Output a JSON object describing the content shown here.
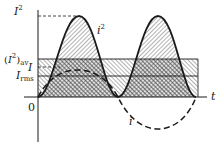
{
  "diagram": {
    "title": "",
    "colors": {
      "ink": "#1a1a1a",
      "hatch": "#555555",
      "background": "#ffffff"
    },
    "labels": {
      "i_squared_axis": {
        "base": "I",
        "sup": "2"
      },
      "i_squared_avg": {
        "open": "(",
        "base": "I",
        "sup": "2",
        "close": ")",
        "sub": "av"
      },
      "i_peak": "I",
      "i_rms": {
        "base": "I",
        "sub": "rms"
      },
      "origin": "0",
      "time_axis": "t",
      "curve_i_squared": {
        "base": "i",
        "sup": "2"
      },
      "curve_i": "i"
    },
    "legend_notes": {
      "solid_curve": "i squared (instantaneous power-proportional)",
      "dashed_curve": "i (instantaneous current)",
      "shaded_band": "average of i squared"
    }
  }
}
